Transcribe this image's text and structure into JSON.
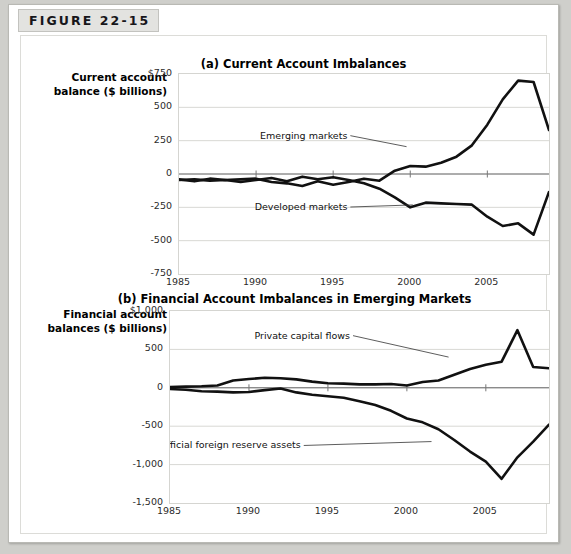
{
  "figure": {
    "tab_label": "FIGURE 22-15"
  },
  "chart_data": [
    {
      "type": "line",
      "panel": "a",
      "title": "(a) Current Account Imbalances",
      "ylabel": "Current account balance ($ billions)",
      "xlabel": "",
      "xlim": [
        1985,
        2009
      ],
      "ylim": [
        -750,
        750
      ],
      "yticks": [
        "$750",
        "500",
        "250",
        "0",
        "-250",
        "-500",
        "-750"
      ],
      "ytick_values": [
        750,
        500,
        250,
        0,
        -250,
        -500,
        -750
      ],
      "xticks": [
        "1985",
        "1990",
        "1995",
        "2000",
        "2005"
      ],
      "xtick_values": [
        1985,
        1990,
        1995,
        2000,
        2005
      ],
      "grid": true,
      "legend": "annotations",
      "x": [
        1985,
        1986,
        1987,
        1988,
        1989,
        1990,
        1991,
        1992,
        1993,
        1994,
        1995,
        1996,
        1997,
        1998,
        1999,
        2000,
        2001,
        2002,
        2003,
        2004,
        2005,
        2006,
        2007,
        2008,
        2009
      ],
      "series": [
        {
          "name": "Emerging markets",
          "annotation": "Emerging markets",
          "values": [
            -40,
            -55,
            -35,
            -45,
            -40,
            -35,
            -60,
            -70,
            -90,
            -55,
            -80,
            -60,
            -35,
            -50,
            25,
            60,
            55,
            85,
            130,
            215,
            370,
            560,
            700,
            690,
            330
          ]
        },
        {
          "name": "Developed markets",
          "annotation": "Developed markets",
          "values": [
            -45,
            -40,
            -50,
            -45,
            -60,
            -45,
            -30,
            -55,
            -20,
            -40,
            -25,
            -45,
            -70,
            -110,
            -175,
            -250,
            -215,
            -220,
            -225,
            -230,
            -320,
            -390,
            -370,
            -455,
            -135
          ]
        }
      ]
    },
    {
      "type": "line",
      "panel": "b",
      "title": "(b) Financial Account Imbalances in Emerging Markets",
      "ylabel": "Financial account balances ($ billions)",
      "xlabel": "",
      "xlim": [
        1985,
        2009
      ],
      "ylim": [
        -1500,
        1000
      ],
      "yticks": [
        "$1,000",
        "500",
        "0",
        "-500",
        "-1,000",
        "-1,500"
      ],
      "ytick_values": [
        1000,
        500,
        0,
        -500,
        -1000,
        -1500
      ],
      "xticks": [
        "1985",
        "1990",
        "1995",
        "2000",
        "2005"
      ],
      "xtick_values": [
        1985,
        1990,
        1995,
        2000,
        2005
      ],
      "grid": true,
      "legend": "annotations",
      "x": [
        1985,
        1986,
        1987,
        1988,
        1989,
        1990,
        1991,
        1992,
        1993,
        1994,
        1995,
        1996,
        1997,
        1998,
        1999,
        2000,
        2001,
        2002,
        2003,
        2004,
        2005,
        2006,
        2007,
        2008,
        2009
      ],
      "series": [
        {
          "name": "Private capital flows",
          "annotation": "Private capital flows",
          "values": [
            10,
            15,
            20,
            30,
            95,
            115,
            130,
            125,
            110,
            80,
            60,
            55,
            45,
            45,
            50,
            30,
            75,
            95,
            170,
            245,
            300,
            340,
            750,
            270,
            255
          ]
        },
        {
          "name": "Official foreign reserve assets",
          "annotation": "Official foreign reserve assets",
          "values": [
            -15,
            -25,
            -45,
            -50,
            -60,
            -55,
            -30,
            -10,
            -60,
            -90,
            -110,
            -130,
            -175,
            -225,
            -300,
            -400,
            -450,
            -540,
            -680,
            -830,
            -960,
            -1185,
            -905,
            -700,
            -480
          ]
        }
      ]
    }
  ]
}
